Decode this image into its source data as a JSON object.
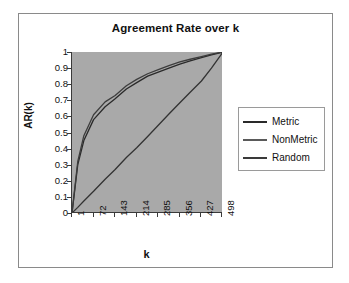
{
  "figure": {
    "background_color": "#ffffff",
    "frame_color": "#8a8a8a",
    "plot_background_color": "#a9a9a9",
    "axis_color": "#3a3a3a"
  },
  "chart_data": {
    "type": "line",
    "title": "Agreement Rate over k",
    "xlabel": "k",
    "ylabel": "AR(k)",
    "xlim": [
      1,
      498
    ],
    "ylim": [
      0,
      1
    ],
    "grid": false,
    "legend_position": "right",
    "xticks": [
      "1",
      "72",
      "143",
      "214",
      "285",
      "356",
      "427",
      "498"
    ],
    "xtick_values": [
      1,
      72,
      143,
      214,
      285,
      356,
      427,
      498
    ],
    "yticks": [
      "0",
      "0.1",
      "0.2",
      "0.3",
      "0.4",
      "0.5",
      "0.6",
      "0.7",
      "0.8",
      "0.9",
      "1"
    ],
    "ytick_values": [
      0,
      0.1,
      0.2,
      0.3,
      0.4,
      0.5,
      0.6,
      0.7,
      0.8,
      0.9,
      1
    ],
    "x": [
      1,
      20,
      40,
      72,
      110,
      143,
      180,
      214,
      250,
      285,
      320,
      356,
      390,
      427,
      460,
      498
    ],
    "series": [
      {
        "name": "Metric",
        "color": "#2a2a2a",
        "values": [
          0.0,
          0.3,
          0.45,
          0.58,
          0.66,
          0.71,
          0.77,
          0.81,
          0.85,
          0.875,
          0.9,
          0.925,
          0.945,
          0.965,
          0.982,
          1.0
        ]
      },
      {
        "name": "NonMetric",
        "color": "#3d3d3d",
        "values": [
          0.0,
          0.32,
          0.48,
          0.61,
          0.69,
          0.73,
          0.79,
          0.83,
          0.865,
          0.89,
          0.915,
          0.938,
          0.955,
          0.972,
          0.987,
          1.0
        ]
      },
      {
        "name": "Random",
        "color": "#333333",
        "values": [
          0.0,
          0.035,
          0.075,
          0.135,
          0.21,
          0.27,
          0.345,
          0.405,
          0.475,
          0.545,
          0.615,
          0.685,
          0.75,
          0.82,
          0.9,
          1.0
        ]
      }
    ]
  },
  "legend": {
    "items": [
      {
        "label": "Metric",
        "color": "#2a2a2a"
      },
      {
        "label": "NonMetric",
        "color": "#5a5a5a"
      },
      {
        "label": "Random",
        "color": "#3a3a3a"
      }
    ]
  }
}
